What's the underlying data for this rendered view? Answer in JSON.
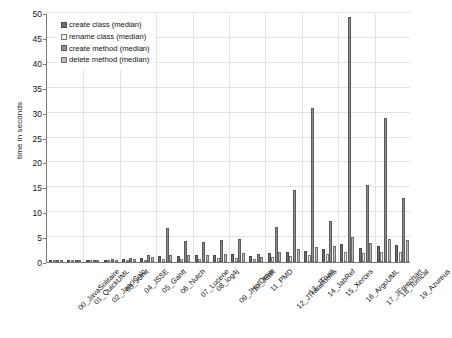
{
  "chart_data": {
    "type": "bar",
    "title": "",
    "xlabel": "",
    "ylabel": "time in seconds",
    "ylim": [
      0,
      50
    ],
    "yticks": [
      0,
      5,
      10,
      15,
      20,
      25,
      30,
      35,
      40,
      45,
      50
    ],
    "grid": true,
    "legend_position": "top-left",
    "categories": [
      "00_JavaSolitaire",
      "01_QuickUML",
      "02_JasciCalc",
      "03_JUnit",
      "04_JSSE",
      "05_Gantt",
      "06_Nutch",
      "07_Lucene",
      "08_log4j",
      "09_JHotDraw",
      "10_JEdit",
      "11_PMD",
      "12_JTransforms",
      "13_JTrust",
      "14_JabRef",
      "15_Xerces",
      "16_ArgoUML",
      "17_JFreechart",
      "18_Tomcat",
      "19_Azureus"
    ],
    "series": [
      {
        "name": "create class (median)",
        "color": "#6e6e6e",
        "values": [
          0.5,
          0.4,
          0.4,
          0.5,
          0.6,
          0.9,
          1.2,
          1.3,
          1.4,
          1.5,
          1.6,
          1.3,
          1.8,
          2.0,
          2.3,
          2.6,
          3.6,
          2.8,
          3.3,
          3.4
        ]
      },
      {
        "name": "rename class (median)",
        "color": "#f2f2f2",
        "values": [
          0.3,
          0.3,
          0.3,
          0.4,
          0.4,
          0.5,
          0.6,
          0.7,
          0.7,
          0.8,
          0.9,
          0.7,
          1.0,
          1.2,
          1.4,
          1.6,
          2.1,
          1.8,
          2.0,
          2.1
        ]
      },
      {
        "name": "create method (median)",
        "color": "#8f8f8f",
        "values": [
          0.4,
          0.4,
          0.5,
          0.6,
          0.9,
          1.4,
          6.9,
          4.2,
          4.1,
          4.4,
          4.6,
          1.6,
          7.0,
          14.4,
          31.0,
          8.2,
          49.2,
          15.5,
          29.0,
          12.8
        ]
      },
      {
        "name": "delete method (median)",
        "color": "#bdbdbd",
        "values": [
          0.3,
          0.3,
          0.4,
          0.5,
          0.7,
          1.0,
          1.4,
          1.5,
          1.5,
          1.7,
          1.8,
          1.1,
          2.0,
          2.6,
          3.1,
          3.3,
          5.0,
          3.9,
          4.6,
          4.4
        ]
      }
    ]
  },
  "legend": {
    "items": [
      {
        "label": "create class (median)"
      },
      {
        "label": "rename class (median)"
      },
      {
        "label": "create method (median)"
      },
      {
        "label": "delete method (median)"
      }
    ]
  }
}
